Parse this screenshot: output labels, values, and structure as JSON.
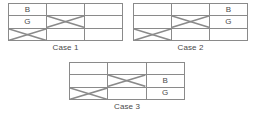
{
  "figures": [
    {
      "id": "case1",
      "caption": "Case 1",
      "columns": 3,
      "rows": 3,
      "cells": [
        {
          "label": "B",
          "crossed": false
        },
        {
          "label": "",
          "crossed": false
        },
        {
          "label": "",
          "crossed": false
        },
        {
          "label": "G",
          "crossed": false
        },
        {
          "label": "",
          "crossed": true
        },
        {
          "label": "",
          "crossed": false
        },
        {
          "label": "",
          "crossed": true
        },
        {
          "label": "",
          "crossed": false
        },
        {
          "label": "",
          "crossed": false
        }
      ]
    },
    {
      "id": "case2",
      "caption": "Case 2",
      "columns": 3,
      "rows": 3,
      "cells": [
        {
          "label": "",
          "crossed": false
        },
        {
          "label": "",
          "crossed": false
        },
        {
          "label": "B",
          "crossed": false
        },
        {
          "label": "",
          "crossed": false
        },
        {
          "label": "",
          "crossed": true
        },
        {
          "label": "G",
          "crossed": false
        },
        {
          "label": "",
          "crossed": true
        },
        {
          "label": "",
          "crossed": false
        },
        {
          "label": "",
          "crossed": false
        }
      ]
    },
    {
      "id": "case3",
      "caption": "Case 3",
      "columns": 3,
      "rows": 3,
      "cells": [
        {
          "label": "",
          "crossed": false
        },
        {
          "label": "",
          "crossed": false
        },
        {
          "label": "",
          "crossed": false
        },
        {
          "label": "",
          "crossed": false
        },
        {
          "label": "",
          "crossed": true
        },
        {
          "label": "B",
          "crossed": false
        },
        {
          "label": "",
          "crossed": true
        },
        {
          "label": "",
          "crossed": false
        },
        {
          "label": "G",
          "crossed": false
        }
      ]
    }
  ],
  "style": {
    "line_color": "#8a8a8a",
    "text_color": "#4a4a4a",
    "background": "#ffffff"
  }
}
